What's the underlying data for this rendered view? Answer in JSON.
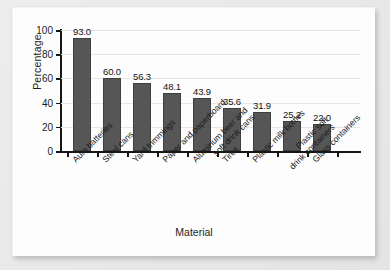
{
  "chart_data": {
    "type": "bar",
    "title": "",
    "xlabel": "Material",
    "ylabel": "Percentage",
    "categories": [
      "Auto batteries",
      "Steel cans",
      "Yard trimmings",
      "Paper and paperboard",
      "Aluminum beer and soft drink cans",
      "Tires",
      "Plastic milk bottles",
      "Plastic soft drink containers",
      "Glass containers"
    ],
    "category_lines": [
      [
        "Auto batteries"
      ],
      [
        "Steel cans"
      ],
      [
        "Yard trimmings"
      ],
      [
        "Paper and paperboard"
      ],
      [
        "Aluminum beer and",
        "soft drink cans"
      ],
      [
        "Tires"
      ],
      [
        "Plastic milk bottles"
      ],
      [
        "Plastic soft",
        "drink containers"
      ],
      [
        "Glass containers"
      ]
    ],
    "values": [
      93.0,
      60.0,
      56.3,
      48.1,
      43.9,
      35.6,
      31.9,
      25.2,
      22.0
    ],
    "value_labels": [
      "93.0",
      "60.0",
      "56.3",
      "48.1",
      "43.9",
      "35.6",
      "31.9",
      "25.2",
      "22.0"
    ],
    "ylim": [
      0,
      100
    ],
    "yticks": [
      0,
      20,
      40,
      60,
      80,
      100
    ],
    "ytick_labels": [
      "0",
      "20",
      "40",
      "60",
      "80",
      "100"
    ],
    "grid": true,
    "legend": "none",
    "bar_color": "#565656",
    "axis_color": "#161616",
    "plot_background": "#fdfdfd",
    "page_background": "#e9e9e9"
  }
}
